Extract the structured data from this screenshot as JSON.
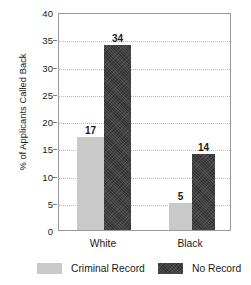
{
  "chart_data": {
    "type": "bar",
    "title": "",
    "subtitle": "",
    "xlabel": "",
    "ylabel": "% of Applicants Called Back",
    "categories": [
      "White",
      "Black"
    ],
    "series": [
      {
        "name": "Criminal Record",
        "values": [
          17,
          5
        ],
        "color": "#c9c9c9"
      },
      {
        "name": "No Record",
        "values": [
          34,
          14
        ],
        "color": "#333333"
      }
    ],
    "ylim": [
      0,
      40
    ],
    "ytick_step": 5,
    "yticks": [
      0,
      5,
      10,
      15,
      20,
      25,
      30,
      35,
      40
    ],
    "ytick_labels": [
      "0",
      "5",
      "10",
      "15",
      "20",
      "25",
      "30",
      "35",
      "40"
    ],
    "grid": "horizontal-dotted",
    "legend_position": "bottom",
    "data_labels": [
      "17",
      "34",
      "5",
      "14"
    ],
    "bar_value_labels": {
      "white_criminal_record": "17",
      "white_no_record": "34",
      "black_criminal_record": "5",
      "black_no_record": "14"
    }
  },
  "axis": {
    "y_title": "% of Applicants Called Back",
    "y_ticks": [
      "40",
      "35",
      "30",
      "25",
      "20",
      "15",
      "10",
      "5",
      "0"
    ],
    "x_categories": [
      "White",
      "Black"
    ]
  },
  "legend": {
    "items": [
      {
        "label": "Criminal Record",
        "swatch": "light-gray-swatch"
      },
      {
        "label": "No Record",
        "swatch": "dark-gray-swatch"
      }
    ]
  },
  "colors": {
    "criminal_record": "#c9c9c9",
    "no_record": "#333333",
    "gridline": "#b8b8b8",
    "frame": "#999999",
    "text": "#1a1a1a",
    "background": "#ffffff"
  }
}
